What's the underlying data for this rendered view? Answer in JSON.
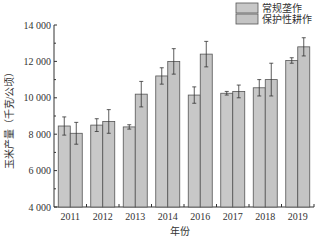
{
  "chart_data": {
    "type": "bar",
    "title": "",
    "xlabel": "年份",
    "ylabel": "玉米产量（千克/公顷）",
    "categories": [
      "2011",
      "2012",
      "2013",
      "2014",
      "2016",
      "2017",
      "2018",
      "2019"
    ],
    "series": [
      {
        "name": "常规垄作",
        "values": [
          8450,
          8500,
          8400,
          11200,
          10150,
          10250,
          10550,
          12050
        ],
        "error": [
          500,
          350,
          120,
          450,
          450,
          100,
          450,
          150
        ],
        "color": "#c8c8c8"
      },
      {
        "name": "保护性耕作",
        "values": [
          8050,
          8700,
          10200,
          12000,
          12400,
          10350,
          11000,
          12800
        ],
        "error": [
          600,
          650,
          700,
          700,
          700,
          350,
          900,
          500
        ],
        "color": "#c4c4c4"
      }
    ],
    "ylim": [
      4000,
      14000
    ],
    "yticks": [
      4000,
      6000,
      8000,
      10000,
      12000,
      14000
    ],
    "ytick_labels": [
      "4 000",
      "6 000",
      "8 000",
      "10 000",
      "12 000",
      "14 000"
    ],
    "grid": false,
    "legend_position": "top-right"
  }
}
